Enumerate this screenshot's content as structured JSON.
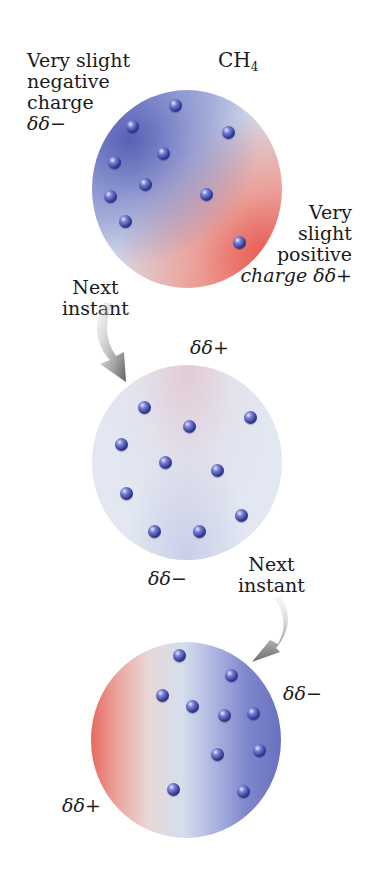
{
  "molecule": {
    "formula_main": "CH",
    "formula_sub": "4"
  },
  "panels": [
    {
      "state": "initial",
      "gradient": {
        "negative_side": "upper-left",
        "positive_side": "lower-right"
      },
      "labels": {
        "negative": [
          "Very slight",
          "negative",
          "charge",
          "δδ−"
        ],
        "positive": [
          "Very",
          "slight",
          "positive",
          "charge δδ+"
        ]
      },
      "electron_count": 10
    },
    {
      "state": "next_instant_1",
      "gradient": {
        "negative_side": "bottom (faint)",
        "positive_side": "top (faint)"
      },
      "labels": {
        "top": "δδ+",
        "bottom": "δδ−"
      },
      "electron_count": 10
    },
    {
      "state": "next_instant_2",
      "gradient": {
        "negative_side": "right",
        "positive_side": "left"
      },
      "labels": {
        "right": "δδ−",
        "left": "δδ+"
      },
      "electron_count": 11
    }
  ],
  "arrows": [
    {
      "label": [
        "Next",
        "instant"
      ]
    },
    {
      "label": [
        "Next",
        "instant"
      ]
    }
  ],
  "colors": {
    "negative": "#5c63b8",
    "neutral": "#dde3ee",
    "positive": "#e8675c",
    "electron": "#2d3490",
    "arrow": "#6e6e6e"
  }
}
